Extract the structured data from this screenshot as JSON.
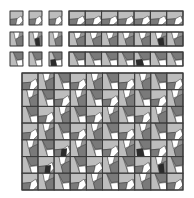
{
  "palette": {
    "background": "#ffffff",
    "light": "#bdbdbd",
    "mid": "#969696",
    "darkgray": "#7a7a7a",
    "white": "#ffffff",
    "dark": "#2b2b2b",
    "stroke": "#3a3a3a"
  },
  "small_tiles": {
    "rows": [
      {
        "name": "row-1",
        "singles": [
          {
            "variant": "a",
            "dark": false
          },
          {
            "variant": "a",
            "dark": false
          },
          {
            "variant": "a",
            "dark": false
          }
        ],
        "strip": [
          {
            "variant": "a",
            "dark": false
          },
          {
            "variant": "a",
            "dark": false
          },
          {
            "variant": "a",
            "dark": false
          },
          {
            "variant": "a",
            "dark": false
          },
          {
            "variant": "a",
            "dark": false
          },
          {
            "variant": "a",
            "dark": false
          },
          {
            "variant": "a",
            "dark": false
          }
        ]
      },
      {
        "name": "row-2",
        "singles": [
          {
            "variant": "b",
            "dark": false
          },
          {
            "variant": "b",
            "dark": true
          },
          {
            "variant": "b",
            "dark": false
          }
        ],
        "strip": [
          {
            "variant": "b",
            "dark": false
          },
          {
            "variant": "b",
            "dark": false
          },
          {
            "variant": "b",
            "dark": false
          },
          {
            "variant": "b",
            "dark": false
          },
          {
            "variant": "b",
            "dark": false
          },
          {
            "variant": "b",
            "dark": true
          },
          {
            "variant": "b",
            "dark": false
          }
        ]
      },
      {
        "name": "row-3",
        "singles": [
          {
            "variant": "c",
            "dark": false
          },
          {
            "variant": "c",
            "dark": false
          },
          {
            "variant": "c",
            "dark": true
          }
        ],
        "strip": [
          {
            "variant": "c",
            "dark": false
          },
          {
            "variant": "c",
            "dark": false
          },
          {
            "variant": "c",
            "dark": false
          },
          {
            "variant": "c",
            "dark": false
          },
          {
            "variant": "c",
            "dark": true
          },
          {
            "variant": "c",
            "dark": false
          },
          {
            "variant": "c",
            "dark": false
          }
        ]
      }
    ]
  },
  "large_grid": {
    "columns": 10,
    "rows": 7,
    "dark_cells": [
      [
        4,
        2
      ],
      [
        4,
        7
      ],
      [
        5,
        1
      ],
      [
        5,
        8
      ]
    ]
  }
}
